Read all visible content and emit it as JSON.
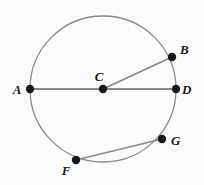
{
  "figure": {
    "kind": "circle-geometry-diagram",
    "background_color": "#fbfbfb",
    "stroke_color": "#8a8a8a",
    "point_color": "#16181c",
    "label_color": "#16181c",
    "circle": {
      "center_label": "C",
      "center": {
        "x": 103,
        "y": 89
      },
      "radius": 73,
      "stroke_width": 1.3
    },
    "points": [
      {
        "id": "A",
        "label": "A",
        "x": 30,
        "y": 89,
        "dot_radius": 4.2,
        "label_x": 17,
        "label_y": 94,
        "on_circle": true
      },
      {
        "id": "C",
        "label": "C",
        "x": 103,
        "y": 89,
        "dot_radius": 4.2,
        "label_x": 99,
        "label_y": 81,
        "on_circle": false
      },
      {
        "id": "D",
        "label": "D",
        "x": 176,
        "y": 89,
        "dot_radius": 4.2,
        "label_x": 182,
        "label_y": 94,
        "on_circle": true
      },
      {
        "id": "B",
        "label": "B",
        "x": 172,
        "y": 57,
        "dot_radius": 4.2,
        "label_x": 180,
        "label_y": 54,
        "on_circle": true
      },
      {
        "id": "G",
        "label": "G",
        "x": 162,
        "y": 139,
        "dot_radius": 4.2,
        "label_x": 171,
        "label_y": 145,
        "on_circle": true
      },
      {
        "id": "F",
        "label": "F",
        "x": 76,
        "y": 160,
        "dot_radius": 4.2,
        "label_x": 66,
        "label_y": 175,
        "on_circle": true
      }
    ],
    "segments": [
      {
        "id": "AD",
        "name": "diameter-a-d",
        "from": "A",
        "to": "D",
        "x1": 30,
        "y1": 89,
        "x2": 176,
        "y2": 89,
        "stroke_width": 2.0
      },
      {
        "id": "CB",
        "name": "radius-c-b",
        "from": "C",
        "to": "B",
        "x1": 103,
        "y1": 89,
        "x2": 172,
        "y2": 57,
        "stroke_width": 1.8
      },
      {
        "id": "FG",
        "name": "chord-f-g",
        "from": "F",
        "to": "G",
        "x1": 76,
        "y1": 160,
        "x2": 162,
        "y2": 139,
        "stroke_width": 1.8
      }
    ]
  }
}
